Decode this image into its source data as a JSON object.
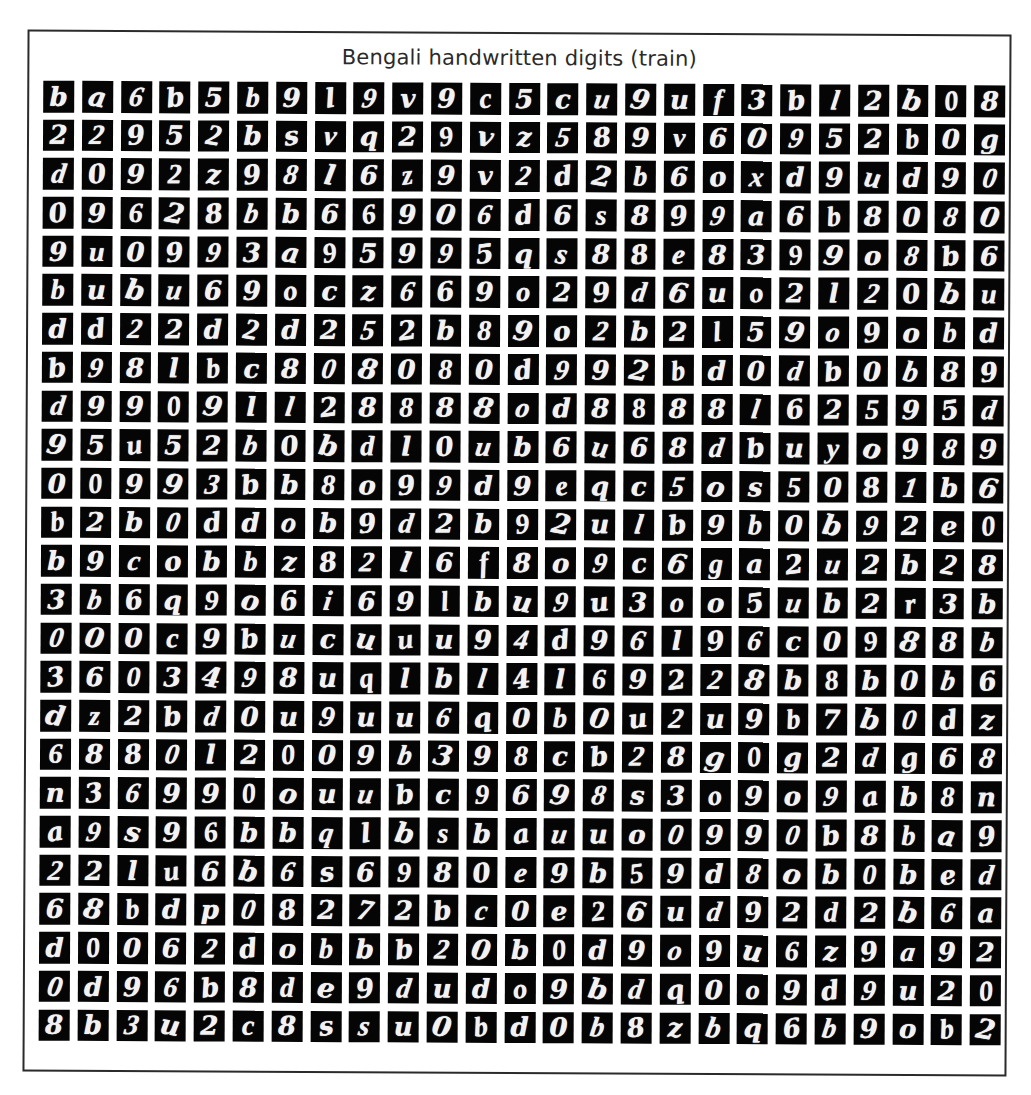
{
  "figure": {
    "title": "Bengali handwritten digits (train)",
    "rows": 25,
    "cols": 25,
    "cell_background": "#000000",
    "stroke_color": "#ffffff",
    "frame_color": "#2b2b2b"
  },
  "grid_rows": [
    "ba6b5b9l9v9c5cu9uf3bl2b08",
    "22952bsvq29vz589v60952b0g",
    "d092z98l6z9v2d2b6oxd9ud90",
    "09628bb66906d6s899a6b808",
    "9u0993a95995qs88e8399o8b6",
    "bubu69ocz669o29d6uo2l20",
    "dd22d2d252b89o2b2l59o9ob",
    "b98lbc808080d992bd0db0b89",
    "d9909ll28888od8888l62595",
    "95u52b0bdl0ub6u68dbuyo98",
    "00993bb8o99d9eqc5os5081b6",
    "b2b0ddob9d2b92ulb9b0b92e0",
    "b9cobbz82l6f8o9c6ga2u2b28",
    "3b6q9o6i69lbu9u3oo5ub2r",
    "000c9bucuuu94d96l96c0988b",
    "3603498uqlbl4l69228b8b0b6",
    "dz2bd0u9uu6q0b0u2u9b7b0",
    "6880l2009b398cb28g0g2dg",
    "n36990ouubc9698s3o9o9ab8",
    "a9s96bbqlbsbauuo0990b8b",
    "22lu6b6s6980e9b59d8ob0bed",
    "68bdp08272bc0e26ud92d2b6a0",
    "d0062dobbb20b0d9o9u6z9a92",
    "0d96b8de9dudo9bdq0o9d9u2",
    "8b3u2c8ssu0bd0b8zbq6b9ob2o"
  ],
  "chart_data": {
    "type": "table",
    "title": "Bengali handwritten digits (train)",
    "layout": "25 x 25 grid of grayscale handwritten digit images",
    "rows": 25,
    "cols": 25
  }
}
